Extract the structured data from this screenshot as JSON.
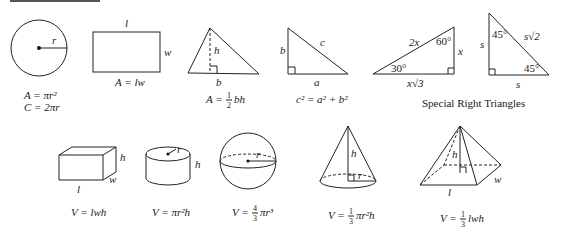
{
  "header_rule": {
    "color": "#555555"
  },
  "plane_figures": {
    "circle": {
      "radius_label": "r",
      "area": "A = πr²",
      "circumference": "C = 2πr"
    },
    "rectangle": {
      "length_label": "l",
      "width_label": "w",
      "area": "A = lw"
    },
    "triangle": {
      "height_label": "h",
      "base_label": "b",
      "area_lhs": "A =",
      "area_num": "1",
      "area_den": "2",
      "area_rhs": "bh"
    },
    "right_triangle": {
      "leg_b": "b",
      "leg_a": "a",
      "hyp_c": "c",
      "formula": "c² = a² + b²"
    }
  },
  "special_right_triangles": {
    "caption": "Special Right Triangles",
    "t30_60_90": {
      "hyp": "2x",
      "short_leg": "x",
      "long_leg": "x√3",
      "angle_top": "60°",
      "angle_left": "30°"
    },
    "t45_45_90": {
      "leg_left": "s",
      "leg_bottom": "s",
      "hyp": "s√2",
      "angle_top": "45°",
      "angle_right": "45°"
    }
  },
  "solids": {
    "box": {
      "l": "l",
      "w": "w",
      "h": "h",
      "volume": "V = lwh"
    },
    "cylinder": {
      "r": "r",
      "h": "h",
      "volume": "V = πr²h"
    },
    "sphere": {
      "r": "r",
      "volume_lhs": "V =",
      "num": "4",
      "den": "3",
      "volume_rhs": "πr³"
    },
    "cone": {
      "r": "r",
      "h": "h",
      "volume_lhs": "V =",
      "num": "1",
      "den": "3",
      "volume_rhs": "πr²h"
    },
    "pyramid": {
      "l": "l",
      "w": "w",
      "h": "h",
      "volume_lhs": "V =",
      "num": "1",
      "den": "3",
      "volume_rhs": "lwh"
    }
  }
}
